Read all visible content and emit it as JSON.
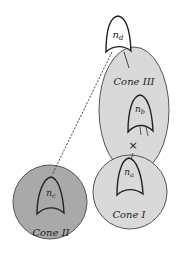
{
  "diagram": {
    "colors": {
      "background": "#ffffff",
      "cone_light": "#d9d9d9",
      "cone_dark": "#a9a9a9",
      "stroke": "#333333"
    },
    "cones": [
      {
        "id": "cone-III",
        "label": "Cone III",
        "shade": "light"
      },
      {
        "id": "cone-I",
        "label": "Cone I",
        "shade": "light"
      },
      {
        "id": "cone-II",
        "label": "Cone II",
        "shade": "dark"
      }
    ],
    "nodes": [
      {
        "id": "n_d",
        "base": "n",
        "sub": "d"
      },
      {
        "id": "n_b",
        "base": "n",
        "sub": "b"
      },
      {
        "id": "n_a",
        "base": "n",
        "sub": "a"
      },
      {
        "id": "n_c",
        "base": "n",
        "sub": "c"
      }
    ],
    "annotations": {
      "cut_mark": "×"
    },
    "edges": [
      {
        "from": "n_d",
        "to": "n_c",
        "style": "dashed"
      },
      {
        "from": "n_d",
        "to": "cone-III",
        "style": "solid"
      },
      {
        "from": "n_b",
        "to": "n_a",
        "style": "solid",
        "cut": true
      }
    ]
  }
}
